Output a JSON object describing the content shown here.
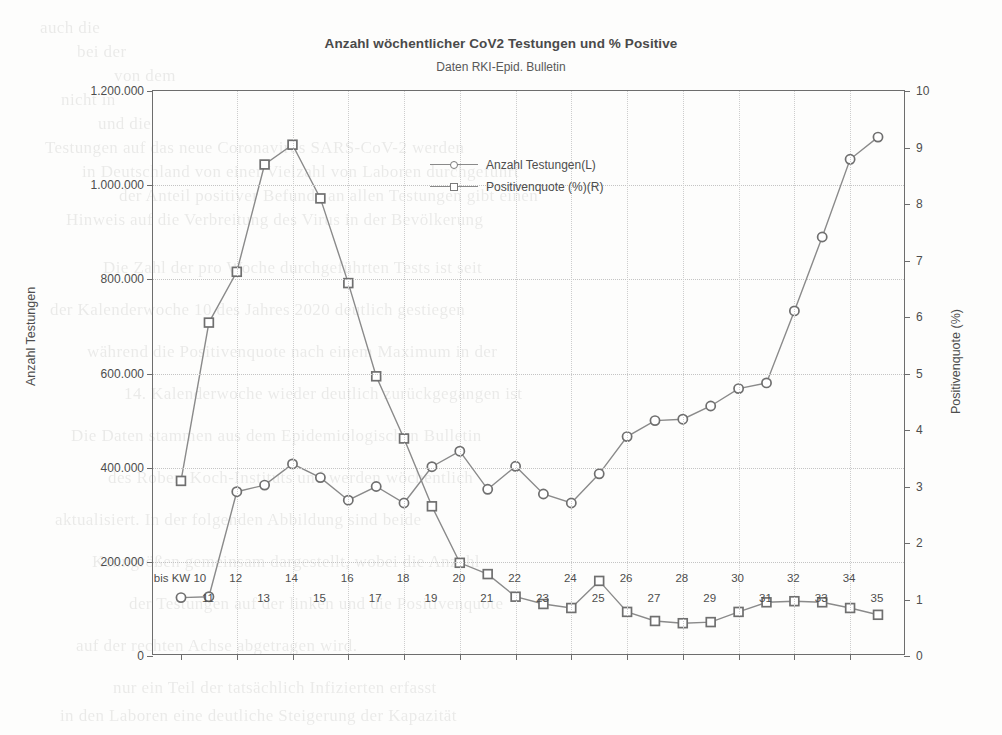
{
  "chart_data": {
    "type": "line",
    "title": "Anzahl wöchentlicher CoV2 Testungen und % Positive",
    "subtitle": "Daten RKI-Epid. Bulletin",
    "xlabel": "",
    "ylabel": "Anzahl Testungen",
    "y2label": "Positivenquote (%)",
    "grid": true,
    "legend_position": "inside-top-center",
    "categories": [
      "bis KW 10",
      "11",
      "12",
      "13",
      "14",
      "15",
      "16",
      "17",
      "18",
      "19",
      "20",
      "21",
      "22",
      "23",
      "24",
      "25",
      "26",
      "27",
      "28",
      "29",
      "30",
      "31",
      "32",
      "33",
      "34",
      "35"
    ],
    "ylim": [
      0,
      1200000
    ],
    "yticks": [
      "0",
      "200.000",
      "400.000",
      "600.000",
      "800.000",
      "1.000.000",
      "1.200.000"
    ],
    "ytick_values": [
      0,
      200000,
      400000,
      600000,
      800000,
      1000000,
      1200000
    ],
    "y2lim": [
      0,
      10
    ],
    "y2ticks": [
      "0",
      "1",
      "2",
      "3",
      "4",
      "5",
      "6",
      "7",
      "8",
      "9",
      "10"
    ],
    "y2tick_values": [
      0,
      1,
      2,
      3,
      4,
      5,
      6,
      7,
      8,
      9,
      10
    ],
    "series": [
      {
        "name": "Anzahl Testungen(L)",
        "axis": "left",
        "marker": "circle",
        "values": [
          124000,
          126000,
          349000,
          363000,
          408000,
          379000,
          331000,
          360000,
          325000,
          402000,
          435000,
          354000,
          403000,
          344000,
          325000,
          387000,
          466000,
          500000,
          503000,
          531000,
          568000,
          580000,
          733000,
          890000,
          1055000,
          1102000
        ]
      },
      {
        "name": "Positivenquote (%)(R)",
        "axis": "right",
        "marker": "square",
        "values": [
          3.1,
          5.9,
          6.8,
          8.7,
          9.05,
          8.1,
          6.6,
          4.95,
          3.85,
          2.65,
          1.65,
          1.45,
          1.05,
          0.92,
          0.85,
          1.33,
          0.78,
          0.62,
          0.58,
          0.6,
          0.78,
          0.95,
          0.97,
          0.95,
          0.85,
          0.73
        ]
      }
    ]
  },
  "legend": {
    "entries": [
      {
        "label": "Anzahl Testungen(L)",
        "marker": "circle"
      },
      {
        "label": "Positivenquote (%)(R)",
        "marker": "square"
      }
    ]
  },
  "background_text": {
    "lines": [
      "auch die",
      "bei der",
      "von dem",
      "nicht in",
      "und die",
      "Testungen auf das neue Coronavirus SARS-CoV-2 werden",
      "in Deutschland von einer Vielzahl von Laboren durchgeführt",
      "der Anteil positiver Befunde an allen Testungen gibt einen",
      "Hinweis auf die Verbreitung des Virus in der Bevölkerung",
      "Die Zahl der pro Woche durchgeführten Tests ist seit",
      "der Kalenderwoche 10 des Jahres 2020 deutlich gestiegen",
      "während die Positivenquote nach einem Maximum in der",
      "14. Kalenderwoche wieder deutlich zurückgegangen ist",
      "Die Daten stammen aus dem Epidemiologischen Bulletin",
      "des Robert Koch-Instituts und werden wöchentlich",
      "aktualisiert. In der folgenden Abbildung sind beide",
      "Kenngrößen gemeinsam dargestellt, wobei die Anzahl",
      "der Testungen auf der linken und die Positivenquote",
      "auf der rechten Achse abgetragen wird.",
      "nur ein Teil der tatsächlich Infizierten erfasst",
      "in den Laboren eine deutliche Steigerung der Kapazität"
    ]
  }
}
